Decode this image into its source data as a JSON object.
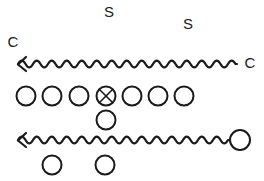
{
  "canvas": {
    "width": 264,
    "height": 181,
    "background": "#ffffff",
    "ink": "#1a1a1a"
  },
  "labels": [
    {
      "name": "label-s-top-left",
      "text": "S",
      "x": 109,
      "y": 13
    },
    {
      "name": "label-s-top-right",
      "text": "S",
      "x": 188,
      "y": 25
    },
    {
      "name": "label-c-left",
      "text": "C",
      "x": 13,
      "y": 43
    },
    {
      "name": "label-c-right",
      "text": "C",
      "x": 250,
      "y": 64
    }
  ],
  "waves": [
    {
      "name": "wavy-line-top",
      "x_start": 18,
      "x_end": 237,
      "y": 64,
      "wavelength": 15,
      "amplitude": 5,
      "arrow": "left",
      "end_circle": false
    },
    {
      "name": "wavy-line-bottom",
      "x_start": 18,
      "x_end": 229,
      "y": 140,
      "wavelength": 15,
      "amplitude": 5,
      "arrow": "left",
      "end_circle": true,
      "end_circle_cx": 240,
      "end_circle_cy": 140,
      "end_circle_r": 10
    }
  ],
  "circle_rows": [
    {
      "name": "circle-row-main",
      "cy": 96,
      "r": 9.5,
      "circles": [
        {
          "name": "circle-1",
          "cx": 26,
          "marked": false
        },
        {
          "name": "circle-2",
          "cx": 52,
          "marked": false
        },
        {
          "name": "circle-3",
          "cx": 79,
          "marked": false
        },
        {
          "name": "circle-4",
          "cx": 106,
          "marked": true
        },
        {
          "name": "circle-5",
          "cx": 132,
          "marked": false
        },
        {
          "name": "circle-6",
          "cx": 158,
          "marked": false
        },
        {
          "name": "circle-7",
          "cx": 184,
          "marked": false
        }
      ]
    },
    {
      "name": "circle-row-middle",
      "cy": 120,
      "r": 9.5,
      "circles": [
        {
          "name": "circle-8",
          "cx": 106,
          "marked": false
        }
      ]
    },
    {
      "name": "circle-row-bottom",
      "cy": 165,
      "r": 9.5,
      "circles": [
        {
          "name": "circle-9",
          "cx": 52,
          "marked": false
        },
        {
          "name": "circle-10",
          "cx": 105,
          "marked": false
        }
      ]
    }
  ],
  "marker": {
    "name": "x-marker",
    "symbol": "X",
    "size": 6
  }
}
